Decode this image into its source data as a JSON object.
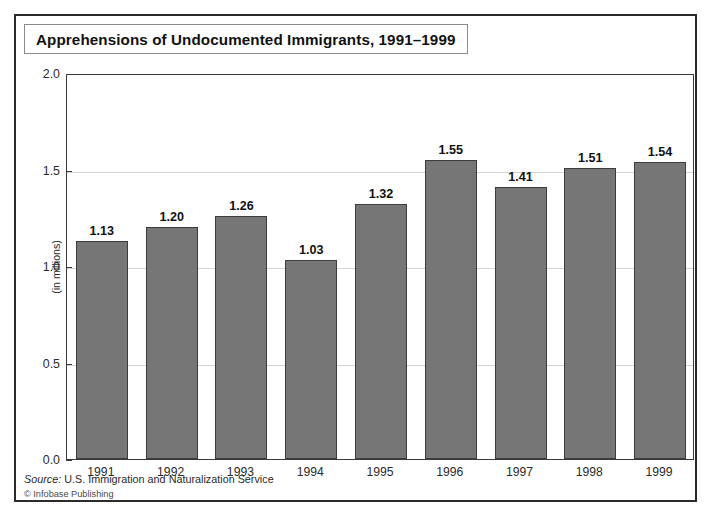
{
  "figure": {
    "title": "Apprehensions of Undocumented Immigrants, 1991–1999",
    "source_label": "Source:",
    "source_text": " U.S. Immigration and Naturalization Service",
    "copyright": "© Infobase Publishing",
    "bar_color": "#767676",
    "bar_border_color": "#3c3c3c",
    "frame_color": "#2b2b2b",
    "gridline_color": "#d2d2d2"
  },
  "chart_data": {
    "type": "bar",
    "title": "Apprehensions of Undocumented Immigrants, 1991–1999",
    "xlabel": "",
    "ylabel": "(in millions)",
    "ylim": [
      0.0,
      2.0
    ],
    "yticks": [
      "0.0",
      "0.5",
      "1.0",
      "1.5",
      "2.0"
    ],
    "ytick_values": [
      0.0,
      0.5,
      1.0,
      1.5,
      2.0
    ],
    "grid": true,
    "legend": false,
    "categories": [
      "1991",
      "1992",
      "1993",
      "1994",
      "1995",
      "1996",
      "1997",
      "1998",
      "1999"
    ],
    "values": [
      1.13,
      1.2,
      1.26,
      1.03,
      1.32,
      1.55,
      1.41,
      1.51,
      1.54
    ],
    "value_labels": [
      "1.13",
      "1.20",
      "1.26",
      "1.03",
      "1.32",
      "1.55",
      "1.41",
      "1.51",
      "1.54"
    ]
  }
}
